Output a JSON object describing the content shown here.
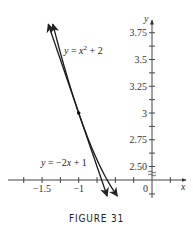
{
  "figure": {
    "caption": "FIGURE 31"
  },
  "chart_data": {
    "type": "line",
    "title": "",
    "caption": "FIGURE 31",
    "xlabel": "x",
    "ylabel": "y",
    "xlim": [
      -1.85,
      0.45
    ],
    "ylim": [
      2.2,
      3.85
    ],
    "y_axis_break": true,
    "grid": false,
    "x_ticks": [
      -1.75,
      -1.5,
      -1.25,
      -1,
      -0.75,
      -0.5,
      -0.25,
      0,
      0.25
    ],
    "x_tick_labels": [
      {
        "value": -1.5,
        "label": "-1.5"
      },
      {
        "value": -1,
        "label": "-1"
      },
      {
        "value": 0,
        "label": "0"
      }
    ],
    "y_ticks": [
      2.5,
      2.625,
      2.75,
      2.875,
      3,
      3.125,
      3.25,
      3.375,
      3.5,
      3.625,
      3.75
    ],
    "y_tick_labels": [
      {
        "value": 3.75,
        "label": "3.75"
      },
      {
        "value": 3.5,
        "label": "3.5"
      },
      {
        "value": 3.25,
        "label": "3.25"
      },
      {
        "value": 3,
        "label": "3"
      },
      {
        "value": 2.75,
        "label": "2.75"
      },
      {
        "value": 2.5,
        "label": "2.50"
      }
    ],
    "series": [
      {
        "name": "y = x^2 + 2",
        "label": "y = x² + 2",
        "kind": "curve",
        "x": [
          -1.353,
          -1.3,
          -1.2,
          -1.1,
          -1.0,
          -0.9,
          -0.8,
          -0.7,
          -0.6,
          -0.5,
          -0.473
        ],
        "y": [
          3.83,
          3.69,
          3.44,
          3.21,
          3.0,
          2.81,
          2.64,
          2.49,
          2.36,
          2.25,
          2.224
        ]
      },
      {
        "name": "y = -2x + 1",
        "label": "y = −2x + 1",
        "kind": "tangent line",
        "x": [
          -1.415,
          -0.612
        ],
        "y": [
          3.83,
          2.224
        ]
      }
    ],
    "annotations": [
      {
        "type": "point",
        "x": -1,
        "y": 3,
        "note": "point of tangency"
      }
    ]
  },
  "labels": {
    "curve_eq_prefix": "y",
    "curve_eq_mid": " = ",
    "curve_eq_var": "x",
    "curve_eq_exp": "2",
    "curve_eq_suffix": " + 2",
    "line_eq_prefix": "y",
    "line_eq_mid": " = −2",
    "line_eq_var": "x",
    "line_eq_suffix": " + 1",
    "x_axis": "x",
    "y_axis": "y",
    "origin": "0"
  }
}
